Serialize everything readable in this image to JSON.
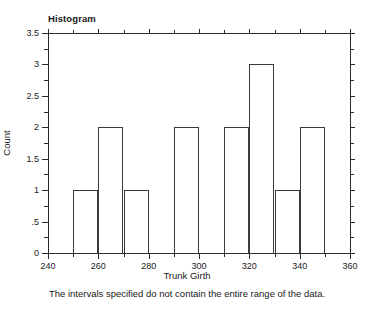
{
  "chart_data": {
    "type": "bar",
    "title": "Histogram",
    "xlabel": "Trunk Girth",
    "ylabel": "Count",
    "footnote": "The intervals specified do not contain the entire range of the data.",
    "bin_width": 10,
    "bin_edges": [
      240,
      250,
      260,
      270,
      280,
      290,
      300,
      310,
      320,
      330,
      340,
      350,
      360
    ],
    "categories": [
      "240-250",
      "250-260",
      "260-270",
      "270-280",
      "280-290",
      "290-300",
      "300-310",
      "310-320",
      "320-330",
      "330-340",
      "340-350",
      "350-360"
    ],
    "values": [
      0,
      1,
      2,
      1,
      0,
      2,
      0,
      2,
      3,
      1,
      2,
      0
    ],
    "xlim": [
      240,
      360
    ],
    "ylim": [
      0,
      3.5
    ],
    "x_major_ticks": [
      240,
      260,
      280,
      300,
      320,
      340,
      360
    ],
    "x_minor_ticks": [
      250,
      270,
      290,
      310,
      330,
      350
    ],
    "x_tick_labels": [
      "240",
      "260",
      "280",
      "300",
      "320",
      "340",
      "360"
    ],
    "y_major_ticks": [
      0,
      0.5,
      1,
      1.5,
      2,
      2.5,
      3,
      3.5
    ],
    "y_minor_ticks": [
      0.25,
      0.75,
      1.25,
      1.75,
      2.25,
      2.75,
      3.25
    ],
    "y_tick_labels": [
      "0",
      ".5",
      "1",
      "1.5",
      "2",
      "2.5",
      "3",
      "3.5"
    ],
    "grid": false,
    "legend": null,
    "bar_fill": "#ffffff",
    "bar_stroke": "#3a3a3a",
    "axis_color": "#2b2b2b",
    "background": "#ffffff"
  }
}
